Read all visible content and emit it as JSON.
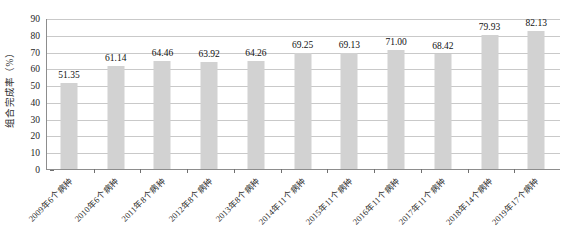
{
  "chart_data": {
    "type": "bar",
    "title": "",
    "xlabel": "",
    "ylabel": "组合完成率（%）",
    "ylim": [
      0,
      90
    ],
    "ytick_step": 10,
    "yticks": [
      "90",
      "80",
      "70",
      "60",
      "50",
      "40",
      "30",
      "20",
      "10",
      "0"
    ],
    "grid": true,
    "legend": false,
    "bar_color": "#d2d2d2",
    "categories": [
      "2009年6个病种",
      "2010年6个病种",
      "2011年8个病种",
      "2012年8个病种",
      "2013年8个病种",
      "2014年11个病种",
      "2015年11个病种",
      "2016年11个病种",
      "2017年11个病种",
      "2018年14个病种",
      "2019年17个病种"
    ],
    "values": [
      51.35,
      61.14,
      64.46,
      63.92,
      64.26,
      69.25,
      69.13,
      71.0,
      68.42,
      79.93,
      82.13
    ],
    "data_labels": [
      "51.35",
      "61.14",
      "64.46",
      "63.92",
      "64.26",
      "69.25",
      "69.13",
      "71.00",
      "68.42",
      "79.93",
      "82.13"
    ]
  }
}
